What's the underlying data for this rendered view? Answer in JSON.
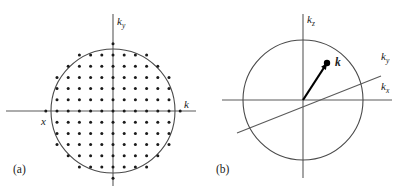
{
  "figure": {
    "width": 409,
    "height": 189,
    "background": "#ffffff",
    "ink": "#1a1a1a",
    "line_color": "#5a5a5a"
  },
  "panel_a": {
    "caption": "(a)",
    "caption_pos": {
      "x": 13,
      "y": 164
    },
    "origin": {
      "x": 113,
      "y": 111
    },
    "circle_radius": 62,
    "x_axis": {
      "x1": 6,
      "y1": 111,
      "x2": 196,
      "y2": 111
    },
    "y_axis": {
      "x1": 113,
      "y1": 14,
      "x2": 113,
      "y2": 186
    },
    "lattice": {
      "spacing": 11.2,
      "half_count": 7,
      "dot_radius": 1.5,
      "clip_radius": 68
    },
    "labels": [
      {
        "name": "k-y-axis-label",
        "text": "k",
        "sub": "y",
        "x": 117,
        "y": 16,
        "bold": false
      },
      {
        "name": "k-axis-label",
        "text": "k",
        "sub": "",
        "x": 184,
        "y": 99,
        "bold": false
      },
      {
        "name": "x-label",
        "text": "x",
        "sub": "",
        "x": 41,
        "y": 116,
        "bold": false
      }
    ]
  },
  "panel_b": {
    "caption": "(b)",
    "caption_pos": {
      "x": 216,
      "y": 164
    },
    "origin": {
      "x": 303,
      "y": 100
    },
    "circle_radius": 60,
    "x_axis": {
      "x1": 222,
      "y1": 100,
      "x2": 392,
      "y2": 100
    },
    "z_axis": {
      "x1": 303,
      "y1": 14,
      "x2": 303,
      "y2": 178
    },
    "y_axis": {
      "x1": 237,
      "y1": 133,
      "x2": 381,
      "y2": 76
    },
    "vector": {
      "name": "k-vector",
      "from": {
        "x": 303,
        "y": 100
      },
      "to": {
        "x": 327,
        "y": 63
      },
      "tip_radius": 3.2,
      "head_size": 7
    },
    "labels": [
      {
        "name": "k-z-axis-label",
        "text": "k",
        "sub": "z",
        "x": 307,
        "y": 14,
        "bold": false
      },
      {
        "name": "k-y-axis-label",
        "text": "k",
        "sub": "y",
        "x": 381,
        "y": 51,
        "bold": false
      },
      {
        "name": "k-x-axis-label",
        "text": "k",
        "sub": "x",
        "x": 381,
        "y": 81,
        "bold": false
      },
      {
        "name": "k-vector-label",
        "text": "k",
        "sub": "",
        "x": 335,
        "y": 57,
        "bold": true
      }
    ]
  }
}
